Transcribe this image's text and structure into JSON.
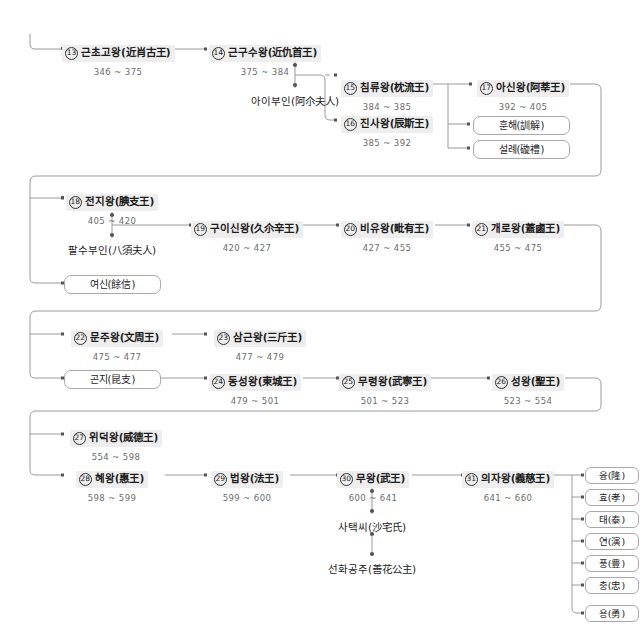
{
  "diagram": {
    "colors": {
      "line": "#9a9a9a",
      "node_highlight": "#eeeeee",
      "text": "#1c1c1c",
      "reign_text": "#6b6b6b",
      "box_border": "#a9a9a9"
    }
  },
  "rows": [
    {
      "id": "row-1",
      "kings": [
        {
          "num": "13",
          "name": "근초고왕(近肖古王)",
          "reign": "346 ~ 375"
        },
        {
          "num": "14",
          "name": "근구수왕(近仇首王)",
          "reign": "375 ~ 384"
        },
        {
          "num": "15",
          "name": "침류왕(枕流王)",
          "reign": "384 ~ 385"
        },
        {
          "num": "16",
          "name": "진사왕(辰斯王)",
          "reign": "385 ~ 392"
        },
        {
          "num": "17",
          "name": "아신왕(阿莘王)",
          "reign": "392 ~ 405"
        }
      ],
      "consorts": [
        {
          "name": "아이부인(阿尒夫人)"
        }
      ],
      "boxes": [
        {
          "name": "훈해(訓解)"
        },
        {
          "name": "설례(䃠禮)"
        }
      ]
    },
    {
      "id": "row-2",
      "kings": [
        {
          "num": "18",
          "name": "전지왕(腆支王)",
          "reign": "405 ~ 420"
        },
        {
          "num": "19",
          "name": "구이신왕(久尒辛王)",
          "reign": "420 ~ 427"
        },
        {
          "num": "20",
          "name": "비유왕(毗有王)",
          "reign": "427 ~ 455"
        },
        {
          "num": "21",
          "name": "개로왕(蓋鹵王)",
          "reign": "455 ~ 475"
        }
      ],
      "consorts": [
        {
          "name": "팔수부인(八須夫人)"
        }
      ],
      "boxes": [
        {
          "name": "여신(餘信)"
        }
      ]
    },
    {
      "id": "row-3",
      "kings": [
        {
          "num": "22",
          "name": "문주왕(文周王)",
          "reign": "475 ~ 477"
        },
        {
          "num": "23",
          "name": "삼근왕(三斤王)",
          "reign": "477 ~ 479"
        },
        {
          "num": "24",
          "name": "동성왕(東城王)",
          "reign": "479 ~ 501"
        },
        {
          "num": "25",
          "name": "무령왕(武寧王)",
          "reign": "501 ~ 523"
        },
        {
          "num": "26",
          "name": "성왕(聖王)",
          "reign": "523 ~ 554"
        }
      ],
      "consorts": [],
      "boxes": [
        {
          "name": "곤지(昆支)"
        }
      ]
    },
    {
      "id": "row-4",
      "kings": [
        {
          "num": "27",
          "name": "위덕왕(威德王)",
          "reign": "554 ~ 598"
        },
        {
          "num": "28",
          "name": "혜왕(惠王)",
          "reign": "598 ~ 599"
        },
        {
          "num": "29",
          "name": "법왕(法王)",
          "reign": "599 ~ 600"
        },
        {
          "num": "30",
          "name": "무왕(武王)",
          "reign": "600 ~ 641"
        },
        {
          "num": "31",
          "name": "의자왕(義慈王)",
          "reign": "641 ~ 660"
        }
      ],
      "consorts": [
        {
          "name": "사택씨(沙宅氏)"
        },
        {
          "name": "선화공주(善花公主)"
        }
      ],
      "boxes": []
    }
  ],
  "sons": [
    {
      "name": "융(隆)"
    },
    {
      "name": "효(孝)"
    },
    {
      "name": "태(泰)"
    },
    {
      "name": "연(演)"
    },
    {
      "name": "풍(豊)"
    },
    {
      "name": "충(忠)"
    },
    {
      "name": "용(勇)"
    }
  ]
}
